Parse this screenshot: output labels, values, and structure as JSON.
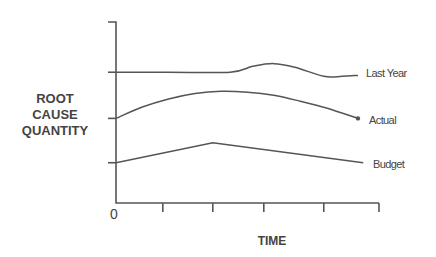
{
  "chart_data": {
    "type": "line",
    "title": "",
    "xlabel": "TIME",
    "ylabel_lines": [
      "ROOT",
      "CAUSE",
      "QUANTITY"
    ],
    "xlim": [
      0,
      5
    ],
    "ylim": [
      0,
      4
    ],
    "x_ticks": [
      0.89,
      1.84,
      2.81,
      3.95,
      5.0
    ],
    "y_ticks": [
      0.89,
      1.87,
      2.89
    ],
    "x_tick_labels": [
      "0"
    ],
    "grid": false,
    "legend": "inline-right",
    "series": [
      {
        "name": "Last Year",
        "label": "Last Year",
        "x": [
          0,
          1.0,
          2.17,
          2.6,
          3.0,
          3.4,
          3.95,
          4.3,
          4.6
        ],
        "y": [
          2.89,
          2.89,
          2.89,
          3.02,
          3.08,
          3.0,
          2.8,
          2.8,
          2.82
        ],
        "marker_end": false
      },
      {
        "name": "Actual",
        "label": "Actual",
        "x": [
          0,
          0.5,
          1.0,
          1.5,
          2.0,
          2.5,
          3.0,
          3.5,
          4.0,
          4.6
        ],
        "y": [
          1.87,
          2.12,
          2.3,
          2.42,
          2.47,
          2.45,
          2.38,
          2.25,
          2.1,
          1.87
        ],
        "marker_end": true
      },
      {
        "name": "Budget",
        "label": "Budget",
        "x": [
          0,
          1.84,
          4.7
        ],
        "y": [
          0.89,
          1.33,
          0.89
        ],
        "marker_end": false
      }
    ]
  }
}
